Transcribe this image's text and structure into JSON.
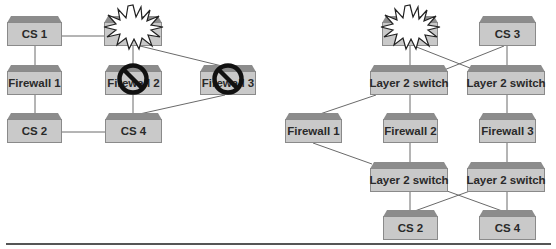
{
  "colors": {
    "box_face": "#c9c9c9",
    "box_bevel": "#8c8c8c",
    "box_border": "#8a8a8a",
    "link": "#6a6a6a",
    "no_symbol": "#111111",
    "rule": "#555555"
  },
  "left_diagram": {
    "nodes": {
      "cs1": {
        "label": "CS 1"
      },
      "failed_node": {
        "label": "",
        "state": "failed-burst-icon"
      },
      "fw1": {
        "label": "Firewall 1"
      },
      "fw2": {
        "label": "Firewall 2",
        "state": "blocked"
      },
      "fw3": {
        "label": "Firewall 3",
        "state": "blocked"
      },
      "cs2": {
        "label": "CS 2"
      },
      "cs4": {
        "label": "CS 4"
      }
    },
    "links": [
      [
        "cs1",
        "failed_node"
      ],
      [
        "cs1",
        "fw1"
      ],
      [
        "failed_node",
        "fw2"
      ],
      [
        "failed_node",
        "fw3"
      ],
      [
        "fw1",
        "cs2"
      ],
      [
        "fw2",
        "cs4"
      ],
      [
        "fw3",
        "cs4"
      ],
      [
        "cs2",
        "cs4"
      ]
    ]
  },
  "right_diagram": {
    "nodes": {
      "failed_node": {
        "label": "",
        "state": "failed-burst-icon"
      },
      "cs3": {
        "label": "CS 3"
      },
      "l2a": {
        "label": "Layer 2 switch"
      },
      "l2b": {
        "label": "Layer 2 switch"
      },
      "fw1": {
        "label": "Firewall 1"
      },
      "fw2": {
        "label": "Firewall 2"
      },
      "fw3": {
        "label": "Firewall 3"
      },
      "l2c": {
        "label": "Layer 2 switch"
      },
      "l2d": {
        "label": "Layer 2 switch"
      },
      "cs2": {
        "label": "CS 2"
      },
      "cs4": {
        "label": "CS 4"
      }
    },
    "links": [
      [
        "failed_node",
        "l2a"
      ],
      [
        "failed_node",
        "l2b"
      ],
      [
        "cs3",
        "l2a"
      ],
      [
        "cs3",
        "l2b"
      ],
      [
        "l2a",
        "fw1"
      ],
      [
        "l2a",
        "fw2"
      ],
      [
        "l2b",
        "fw3"
      ],
      [
        "fw1",
        "l2c"
      ],
      [
        "fw2",
        "l2c"
      ],
      [
        "fw3",
        "l2d"
      ],
      [
        "l2c",
        "cs2"
      ],
      [
        "l2c",
        "cs4"
      ],
      [
        "l2d",
        "cs2"
      ],
      [
        "l2d",
        "cs4"
      ]
    ]
  }
}
